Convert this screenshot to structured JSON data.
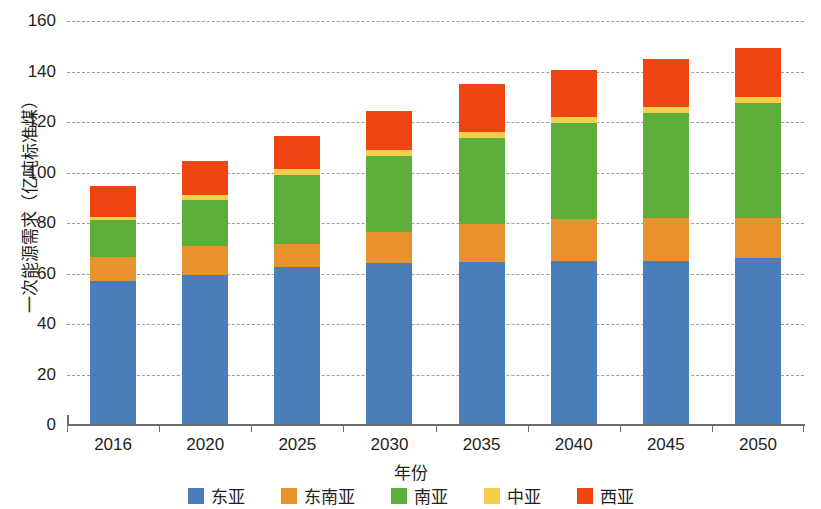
{
  "chart_data": {
    "type": "bar",
    "stacked": true,
    "title": "",
    "xlabel": "年份",
    "ylabel": "一次能源需求（亿吨标准煤）",
    "categories": [
      "2016",
      "2020",
      "2025",
      "2030",
      "2035",
      "2040",
      "2045",
      "2050"
    ],
    "ylim": [
      0,
      160
    ],
    "y_ticks": [
      0,
      20,
      40,
      60,
      80,
      100,
      120,
      140,
      160
    ],
    "y_tick_labels": [
      "0",
      "20",
      "40",
      "60",
      "80",
      "100",
      "120",
      "140",
      "160"
    ],
    "grid": true,
    "legend_position": "bottom",
    "series": [
      {
        "name": "东亚",
        "color": "#4a7ebb",
        "values": [
          57.0,
          59.5,
          62.5,
          64.0,
          64.5,
          65.0,
          65.0,
          66.0
        ]
      },
      {
        "name": "东南亚",
        "color": "#e8922e",
        "values": [
          9.5,
          11.5,
          9.0,
          12.5,
          15.0,
          16.5,
          17.0,
          16.0
        ]
      },
      {
        "name": "南亚",
        "color": "#5cad3a",
        "values": [
          14.5,
          18.0,
          27.5,
          30.0,
          34.0,
          38.0,
          41.5,
          45.5
        ]
      },
      {
        "name": "中亚",
        "color": "#f5cf4c",
        "values": [
          1.5,
          2.0,
          2.5,
          2.5,
          2.5,
          2.5,
          2.5,
          2.5
        ]
      },
      {
        "name": "西亚",
        "color": "#ee4513",
        "values": [
          12.0,
          13.5,
          13.0,
          15.5,
          19.0,
          18.5,
          19.0,
          19.5
        ]
      }
    ],
    "totals": [
      94.5,
      104.5,
      114.5,
      124.5,
      135.0,
      140.5,
      145.0,
      149.5
    ]
  }
}
